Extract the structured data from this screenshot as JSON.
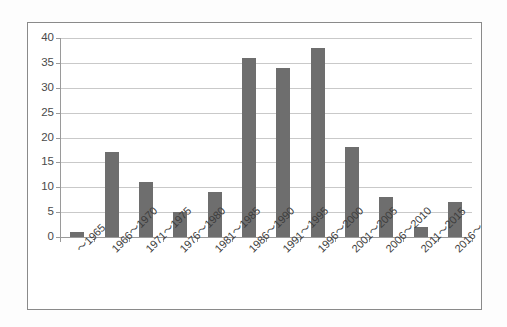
{
  "chart_data": {
    "type": "bar",
    "title": "",
    "subtitle": "",
    "xlabel": "",
    "ylabel": "",
    "categories": [
      "〜1965",
      "1966〜1970",
      "1971〜1975",
      "1976〜1980",
      "1981〜1985",
      "1986〜1990",
      "1991〜1995",
      "1996〜2000",
      "2001〜2005",
      "2006〜2010",
      "2011〜2015",
      "2016〜"
    ],
    "values": [
      1,
      17,
      11,
      5,
      9,
      36,
      34,
      38,
      18,
      8,
      2,
      7
    ],
    "ylim": [
      0,
      40
    ],
    "ytick_labels": [
      "0",
      "5",
      "10",
      "15",
      "20",
      "25",
      "30",
      "35",
      "40"
    ],
    "ytick_values": [
      0,
      5,
      10,
      15,
      20,
      25,
      30,
      35,
      40
    ],
    "grid": true,
    "legend": false,
    "legend_position": "none",
    "series": [
      {
        "name": "",
        "values": [
          1,
          17,
          11,
          5,
          9,
          36,
          34,
          38,
          18,
          8,
          2,
          7
        ]
      }
    ]
  },
  "style": {
    "bar_color": "#6e6e6e",
    "gridline_color": "#c9c9c9",
    "axis_color": "#9a9a9a",
    "frame_color": "#8a8a8a",
    "background_color": "#ffffff",
    "tick_label_color": "#4a4a4a"
  }
}
